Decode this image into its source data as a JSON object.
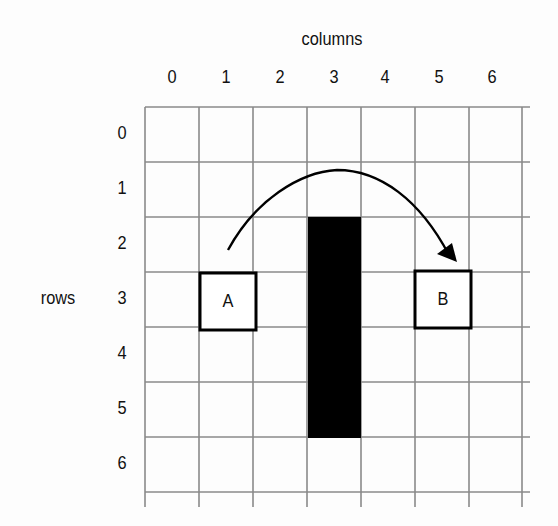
{
  "diagram": {
    "columns_title": "columns",
    "rows_title": "rows",
    "column_labels": [
      "0",
      "1",
      "2",
      "3",
      "4",
      "5",
      "6"
    ],
    "row_labels": [
      "0",
      "1",
      "2",
      "3",
      "4",
      "5",
      "6"
    ],
    "grid": {
      "cols": 7,
      "rows": 7,
      "line_color": "#8a8a8a"
    },
    "obstacle": {
      "column": 3,
      "rows_from": 2,
      "rows_to": 5,
      "color": "#000000"
    },
    "start": {
      "label": "A",
      "row": 3,
      "column": 1
    },
    "goal": {
      "label": "B",
      "row": 3,
      "column": 5
    },
    "arrow": {
      "from": "A",
      "to": "B",
      "shape": "arc over obstacle"
    }
  }
}
